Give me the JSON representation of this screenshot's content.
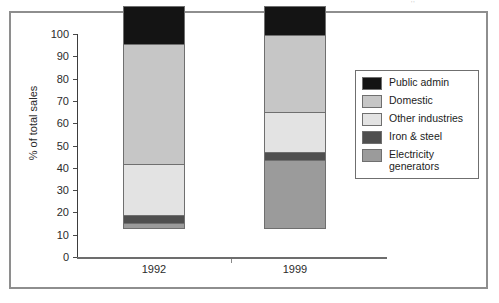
{
  "artifact_text": "''",
  "chart_data": {
    "type": "bar",
    "subtype": "stacked-bar",
    "title": "",
    "xlabel": "",
    "ylabel": "% of total sales",
    "categories": [
      "1992",
      "1999"
    ],
    "ylim": [
      0,
      100
    ],
    "yticks": [
      0,
      10,
      20,
      30,
      40,
      50,
      60,
      70,
      80,
      90,
      100
    ],
    "ytick_labels": [
      "0",
      "10",
      "20",
      "30",
      "40",
      "50",
      "60",
      "70",
      "80",
      "90",
      "100"
    ],
    "grid": false,
    "legend_position": "right",
    "stack_order_bottom_to_top": [
      "Electricity generators",
      "Iron & steel",
      "Other industries",
      "Domestic",
      "Public admin"
    ],
    "series": [
      {
        "name": "Public admin",
        "color": "#141414",
        "values": [
          17,
          13
        ]
      },
      {
        "name": "Domestic",
        "color": "#c6c6c6",
        "values": [
          55,
          35
        ]
      },
      {
        "name": "Other industries",
        "color": "#e3e3e3",
        "values": [
          23,
          18
        ]
      },
      {
        "name": "Iron & steel",
        "color": "#4f4f4f",
        "values": [
          3,
          3
        ]
      },
      {
        "name": "Electricity generators",
        "color": "#9b9b9b",
        "values": [
          2,
          31
        ]
      }
    ],
    "cumulative_tops": {
      "1992": {
        "electricity_generators": 2,
        "iron_and_steel": 5,
        "other_industries": 28,
        "domestic": 83,
        "public_admin": 100
      },
      "1999": {
        "electricity_generators": 31,
        "iron_and_steel": 34,
        "other_industries": 52,
        "domestic": 87,
        "public_admin": 100
      }
    }
  },
  "legend": {
    "items": [
      {
        "label": "Public admin",
        "color": "#141414"
      },
      {
        "label": "Domestic",
        "color": "#c6c6c6"
      },
      {
        "label": "Other industries",
        "color": "#e3e3e3"
      },
      {
        "label": "Iron & steel",
        "color": "#4f4f4f"
      },
      {
        "label": "Electricity generators",
        "color": "#9b9b9b"
      }
    ]
  }
}
